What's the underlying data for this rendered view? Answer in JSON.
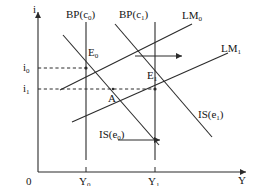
{
  "figure": {
    "type": "economics-diagram",
    "name": "IS-LM-BP model diagram",
    "axes": {
      "y_axis_label": "i",
      "x_axis_label": "Y",
      "origin_label": "0",
      "y_ticks": [
        {
          "id": "i0",
          "base": "i",
          "sub": "0"
        },
        {
          "id": "i1",
          "base": "i",
          "sub": "1"
        }
      ],
      "x_ticks": [
        {
          "id": "Y0",
          "base": "Y",
          "sub": "0"
        },
        {
          "id": "Y1",
          "base": "Y",
          "sub": "1"
        }
      ]
    },
    "curves": [
      {
        "id": "bp0",
        "base": "BP",
        "arg": "c",
        "sub": "0",
        "label": "BP(c0)"
      },
      {
        "id": "bp1",
        "base": "BP",
        "arg": "c",
        "sub": "1",
        "label": "BP(c1)"
      },
      {
        "id": "lm0",
        "base": "LM",
        "arg": "",
        "sub": "0",
        "label": "LM0"
      },
      {
        "id": "lm1",
        "base": "LM",
        "arg": "",
        "sub": "1",
        "label": "LM1"
      },
      {
        "id": "is0",
        "base": "IS",
        "arg": "e",
        "sub": "0",
        "label": "IS(e0)"
      },
      {
        "id": "is1",
        "base": "IS",
        "arg": "e",
        "sub": "1",
        "label": "IS(e1)"
      }
    ],
    "points": [
      {
        "id": "E0",
        "base": "E",
        "sub": "0"
      },
      {
        "id": "E1",
        "base": "E",
        "sub": "1"
      },
      {
        "id": "A",
        "base": "A",
        "sub": ""
      }
    ],
    "shift_arrows": [
      {
        "id": "lm-shift-arrow",
        "direction": "right"
      },
      {
        "id": "is-shift-arrow",
        "direction": "right"
      }
    ],
    "colors": {
      "line": "#2b2b2b",
      "text": "#151515",
      "background": "#ffffff"
    }
  }
}
